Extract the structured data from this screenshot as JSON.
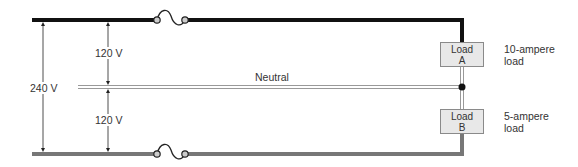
{
  "voltages": {
    "total": "240 V",
    "upper": "120 V",
    "lower": "120 V"
  },
  "neutral_label": "Neutral",
  "loads": [
    {
      "id": "A",
      "line1": "Load",
      "line2": "A",
      "desc1": "10-ampere",
      "desc2": "load"
    },
    {
      "id": "B",
      "line1": "Load",
      "line2": "B",
      "desc1": "5-ampere",
      "desc2": "load"
    }
  ],
  "colors": {
    "hot_top": "#111111",
    "hot_bottom": "#777777",
    "neutral": "#9a9a9a",
    "load_fill": "#e8e8e8",
    "text": "#333333"
  }
}
